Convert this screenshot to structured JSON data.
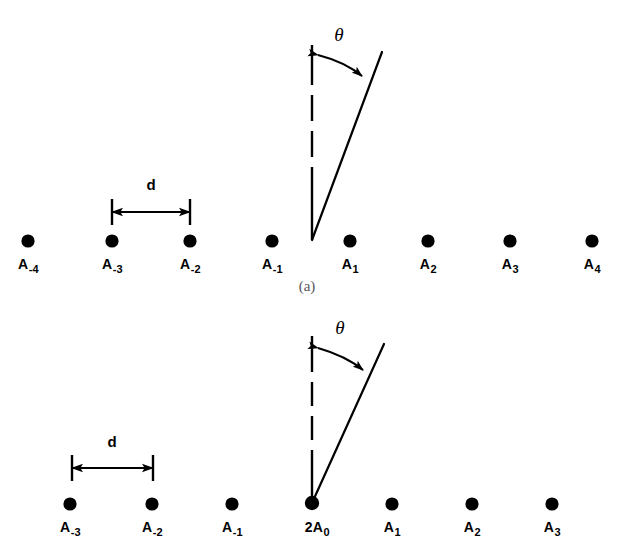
{
  "figure": {
    "caption_a": "(a)",
    "theta_symbol": "θ",
    "dimension_symbol": "d",
    "element_prefix": "A",
    "vertex_multiplier": "2",
    "colors": {
      "ink": "#000000",
      "background": "#ffffff",
      "caption": "#55555a"
    }
  },
  "panel_a": {
    "name": "(a)",
    "caption": "(a)",
    "theta_label": "θ",
    "dimension_label": "d",
    "has_center_element": false,
    "elements": [
      {
        "label_base": "A",
        "subscript": "-4",
        "x": 28,
        "y": 241
      },
      {
        "label_base": "A",
        "subscript": "-3",
        "x": 112,
        "y": 241
      },
      {
        "label_base": "A",
        "subscript": "-2",
        "x": 190,
        "y": 241
      },
      {
        "label_base": "A",
        "subscript": "-1",
        "x": 272,
        "y": 241
      },
      {
        "label_base": "A",
        "subscript": "1",
        "x": 350,
        "y": 241
      },
      {
        "label_base": "A",
        "subscript": "2",
        "x": 428,
        "y": 241
      },
      {
        "label_base": "A",
        "subscript": "3",
        "x": 510,
        "y": 241
      },
      {
        "label_base": "A",
        "subscript": "4",
        "x": 592,
        "y": 241
      }
    ],
    "dimension": {
      "from_x": 112,
      "to_x": 190,
      "y": 212,
      "label_x": 151,
      "label_y": 184
    },
    "vertex": {
      "x": 312,
      "y": 240
    },
    "reference_line": {
      "x": 312,
      "y_top": 45,
      "y_bottom": 240
    },
    "ray": {
      "x_top": 382,
      "y_top": 52,
      "x_bottom": 312,
      "y_bottom": 240
    },
    "theta_arc": {
      "label_x": 339,
      "label_y": 33
    }
  },
  "panel_b": {
    "name": "(b)",
    "caption": "",
    "theta_label": "θ",
    "dimension_label": "d",
    "has_center_element": true,
    "center_prefix": "2",
    "elements": [
      {
        "label_base": "A",
        "subscript": "-3",
        "x": 70,
        "y": 504
      },
      {
        "label_base": "A",
        "subscript": "-2",
        "x": 152,
        "y": 504
      },
      {
        "label_base": "A",
        "subscript": "-1",
        "x": 232,
        "y": 504
      },
      {
        "label_base": "A",
        "subscript": "0",
        "x": 312,
        "y": 504,
        "prefix": "2"
      },
      {
        "label_base": "A",
        "subscript": "1",
        "x": 392,
        "y": 504
      },
      {
        "label_base": "A",
        "subscript": "2",
        "x": 472,
        "y": 504
      },
      {
        "label_base": "A",
        "subscript": "3",
        "x": 552,
        "y": 504
      }
    ],
    "dimension": {
      "from_x": 72,
      "to_x": 153,
      "y": 468,
      "label_x": 112,
      "label_y": 441
    },
    "vertex": {
      "x": 312,
      "y": 503
    },
    "reference_line": {
      "x": 312,
      "y_top": 336,
      "y_bottom": 503
    },
    "ray": {
      "x_top": 384,
      "y_top": 344,
      "x_bottom": 312,
      "y_bottom": 503
    },
    "theta_arc": {
      "label_x": 340,
      "label_y": 326
    }
  }
}
